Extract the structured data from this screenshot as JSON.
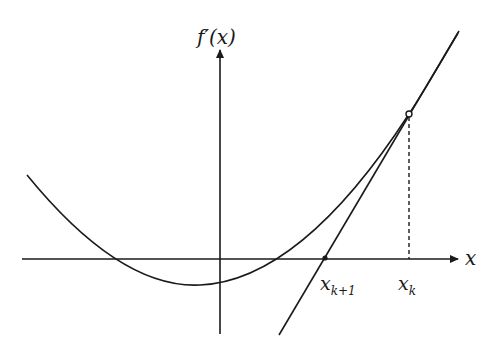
{
  "diagram": {
    "type": "newton-method-illustration",
    "y_axis_label": "f′(x)",
    "x_axis_label": "x",
    "points": [
      {
        "label_base": "x",
        "label_sub": "k+1",
        "role": "tangent-x-intercept"
      },
      {
        "label_base": "x",
        "label_sub": "k",
        "role": "tangent-point"
      }
    ],
    "colors": {
      "stroke": "#1a1a1a",
      "background": "#ffffff"
    }
  }
}
